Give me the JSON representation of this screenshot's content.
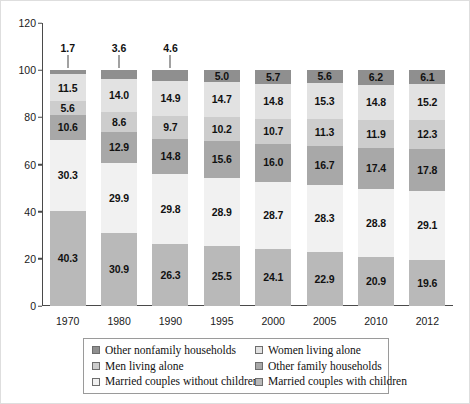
{
  "chart_data": {
    "type": "bar",
    "subtype": "stacked-column-100",
    "title": "",
    "xlabel": "",
    "ylabel": "",
    "ylim": [
      0,
      120
    ],
    "yticks": [
      0,
      20,
      40,
      60,
      80,
      100,
      120
    ],
    "grid": false,
    "legend_position": "bottom",
    "categories": [
      "1970",
      "1980",
      "1990",
      "1995",
      "2000",
      "2005",
      "2010",
      "2012"
    ],
    "series": [
      {
        "name": "Married couples with children",
        "color": "#b9b9b9",
        "values": [
          40.3,
          30.9,
          26.3,
          25.5,
          24.1,
          22.9,
          20.9,
          19.6
        ]
      },
      {
        "name": "Married couples without children",
        "color": "#f1f1f1",
        "values": [
          30.3,
          29.9,
          29.8,
          28.9,
          28.7,
          28.3,
          28.8,
          29.1
        ]
      },
      {
        "name": "Other family households",
        "color": "#a8a8a8",
        "values": [
          10.6,
          12.9,
          14.8,
          15.6,
          16.0,
          16.7,
          17.4,
          17.8
        ]
      },
      {
        "name": "Men living alone",
        "color": "#cdcdcd",
        "values": [
          5.6,
          8.6,
          9.7,
          10.2,
          10.7,
          11.3,
          11.9,
          12.3
        ]
      },
      {
        "name": "Women living alone",
        "color": "#e2e2e2",
        "values": [
          11.5,
          14.0,
          14.9,
          14.7,
          14.8,
          15.3,
          14.8,
          15.2
        ]
      },
      {
        "name": "Other nonfamily households",
        "color": "#8f8f8f",
        "values": [
          1.7,
          3.6,
          4.6,
          5.0,
          5.7,
          5.6,
          6.2,
          6.1
        ]
      }
    ]
  },
  "legend": {
    "entries": [
      {
        "label": "Other nonfamily households",
        "color": "#8f8f8f"
      },
      {
        "label": "Women living alone",
        "color": "#e2e2e2"
      },
      {
        "label": "Men living alone",
        "color": "#cdcdcd"
      },
      {
        "label": "Other family households",
        "color": "#a8a8a8"
      },
      {
        "label": "Married couples without children",
        "color": "#f1f1f1"
      },
      {
        "label": "Married couples with children",
        "color": "#b9b9b9"
      }
    ]
  }
}
